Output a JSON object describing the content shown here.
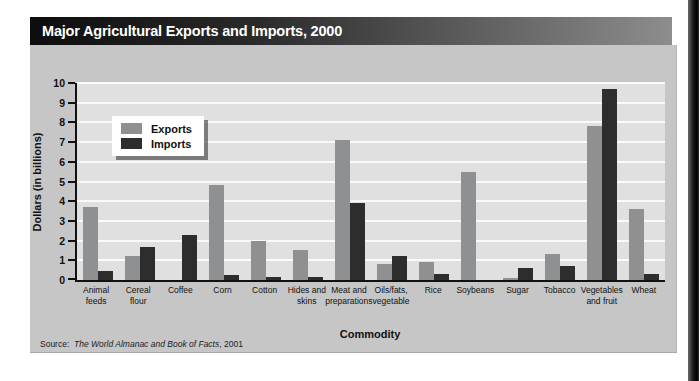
{
  "title_bar": {
    "title": "Major Agricultural Exports and Imports, 2000"
  },
  "chart_data": {
    "type": "bar",
    "title": "Major Agricultural Exports and Imports, 2000",
    "xlabel": "Commodity",
    "ylabel": "Dollars (in billions)",
    "ylim": [
      0,
      10
    ],
    "yticks": [
      0,
      1,
      2,
      3,
      4,
      5,
      6,
      7,
      8,
      9,
      10
    ],
    "grid": true,
    "legend_position": "upper left inside plot",
    "categories": [
      "Animal feeds",
      "Cereal flour",
      "Coffee",
      "Corn",
      "Cotton",
      "Hides and skins",
      "Meat and preparations",
      "Oils/fats, vegetable",
      "Rice",
      "Soybeans",
      "Sugar",
      "Tobacco",
      "Vegetables and fruit",
      "Wheat"
    ],
    "categories_display": [
      [
        "Animal",
        "feeds"
      ],
      [
        "Cereal",
        "flour"
      ],
      [
        "Coffee"
      ],
      [
        "Corn"
      ],
      [
        "Cotton"
      ],
      [
        "Hides and",
        "skins"
      ],
      [
        "Meat and",
        "preparations"
      ],
      [
        "Oils/fats,",
        "vegetable"
      ],
      [
        "Rice"
      ],
      [
        "Soybeans"
      ],
      [
        "Sugar"
      ],
      [
        "Tobacco"
      ],
      [
        "Vegetables",
        "and fruit"
      ],
      [
        "Wheat"
      ]
    ],
    "series": [
      {
        "name": "Exports",
        "color": "#8f9091",
        "values": [
          3.7,
          1.2,
          0,
          4.8,
          2.0,
          1.5,
          7.1,
          0.8,
          0.9,
          5.5,
          0.1,
          1.3,
          7.8,
          3.6
        ]
      },
      {
        "name": "Imports",
        "color": "#2d2d2d",
        "values": [
          0.45,
          1.7,
          2.3,
          0.25,
          0.15,
          0.15,
          3.9,
          1.2,
          0.3,
          0,
          0.6,
          0.7,
          9.7,
          0.3
        ]
      }
    ]
  },
  "legend": {
    "items": [
      {
        "label": "Exports",
        "color": "#8f9091"
      },
      {
        "label": "Imports",
        "color": "#2d2d2d"
      }
    ]
  },
  "axis": {
    "x_title": "Commodity",
    "y_title": "Dollars (in billions)"
  },
  "source": {
    "prefix": "Source:",
    "italic_text": "The World Almanac and Book of Facts",
    "suffix": ", 2001"
  },
  "colors": {
    "panel_bg": "#c6c6c6",
    "plot_bg": "#e0e0e0",
    "gridline": "#fafafa",
    "export_bar": "#8f9091",
    "import_bar": "#2d2d2d",
    "title_bar_left": "#0d0d0d",
    "title_bar_right": "#8d8d8d",
    "title_text": "#ffffff"
  }
}
